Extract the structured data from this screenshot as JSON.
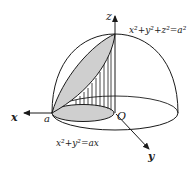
{
  "diagram": {
    "labels": {
      "z_axis": "z",
      "x_axis": "x",
      "y_axis": "y",
      "origin": "O",
      "point_a": "a",
      "sphere_eq": "x²+y²+z²=a²",
      "cylinder_eq": "x²+y²=ax"
    },
    "colors": {
      "stroke": "#1a1a1a",
      "shade": "#cfcfcf"
    }
  }
}
